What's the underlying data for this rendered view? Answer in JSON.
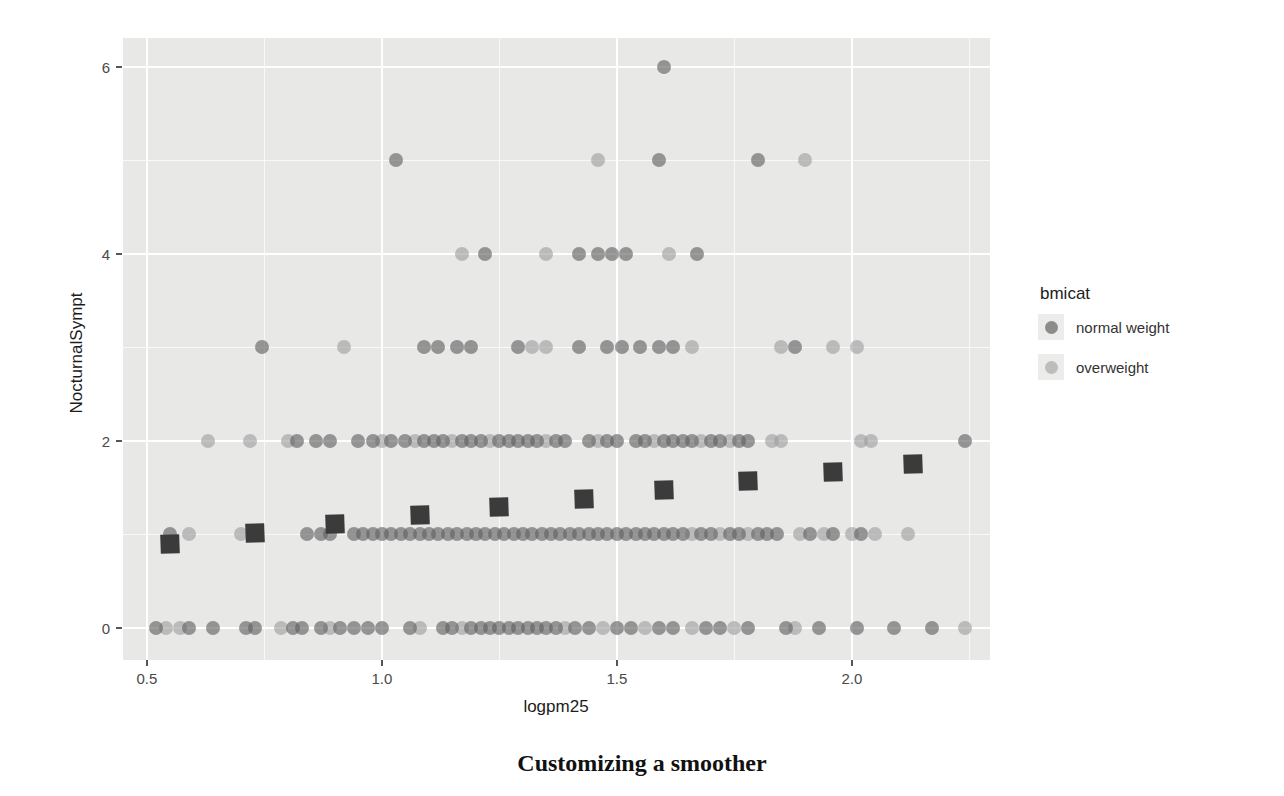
{
  "figure": {
    "caption": "Customizing a smoother"
  },
  "chart_data": {
    "type": "scatter",
    "title": "",
    "xlabel": "logpm25",
    "ylabel": "NocturnalSympt",
    "xlim": [
      0.449,
      2.294
    ],
    "ylim": [
      -0.343,
      6.31
    ],
    "x_ticks": [
      0.5,
      1.0,
      1.5,
      2.0
    ],
    "x_tick_labels": [
      "0.5",
      "1.0",
      "1.5",
      "2.0"
    ],
    "x_minor_ticks": [
      0.75,
      1.25,
      1.75,
      2.25
    ],
    "y_ticks": [
      0,
      2,
      4,
      6
    ],
    "y_tick_labels": [
      "0",
      "2",
      "4",
      "6"
    ],
    "y_minor_ticks": [
      1,
      3,
      5
    ],
    "grid": "on",
    "panel_bg": "#e8e8e6",
    "legend": {
      "position": "right",
      "title": "bmicat",
      "entries": [
        {
          "label": "normal weight",
          "color": "#8c8c8c"
        },
        {
          "label": "overweight",
          "color": "#bdbdbd"
        }
      ]
    },
    "series": [
      {
        "name": "overweight",
        "marker": "circle",
        "color": "rgba(158,158,158,0.62)",
        "points": [
          [
            0.54,
            0
          ],
          [
            0.57,
            0
          ],
          [
            0.785,
            0
          ],
          [
            0.89,
            0
          ],
          [
            1.08,
            0
          ],
          [
            1.17,
            0
          ],
          [
            1.39,
            0
          ],
          [
            1.47,
            0
          ],
          [
            1.56,
            0
          ],
          [
            1.66,
            0
          ],
          [
            1.75,
            0
          ],
          [
            1.88,
            0
          ],
          [
            2.24,
            0
          ],
          [
            0.59,
            1
          ],
          [
            0.7,
            1
          ],
          [
            1.66,
            1
          ],
          [
            1.72,
            1
          ],
          [
            1.78,
            1
          ],
          [
            1.89,
            1
          ],
          [
            1.94,
            1
          ],
          [
            2.0,
            1
          ],
          [
            2.05,
            1
          ],
          [
            2.12,
            1
          ],
          [
            0.63,
            2
          ],
          [
            0.72,
            2
          ],
          [
            0.8,
            2
          ],
          [
            1.0,
            2
          ],
          [
            1.07,
            2
          ],
          [
            1.15,
            2
          ],
          [
            1.23,
            2
          ],
          [
            1.35,
            2
          ],
          [
            1.46,
            2
          ],
          [
            1.58,
            2
          ],
          [
            1.68,
            2
          ],
          [
            1.74,
            2
          ],
          [
            1.83,
            2
          ],
          [
            1.85,
            2
          ],
          [
            2.02,
            2
          ],
          [
            2.04,
            2
          ],
          [
            0.92,
            3
          ],
          [
            1.32,
            3
          ],
          [
            1.35,
            3
          ],
          [
            1.66,
            3
          ],
          [
            1.85,
            3
          ],
          [
            1.96,
            3
          ],
          [
            2.01,
            3
          ],
          [
            1.17,
            4
          ],
          [
            1.35,
            4
          ],
          [
            1.61,
            4
          ],
          [
            1.46,
            5
          ],
          [
            1.9,
            5
          ]
        ]
      },
      {
        "name": "normal weight",
        "marker": "circle",
        "color": "rgba(95,95,95,0.62)",
        "points": [
          [
            0.52,
            0
          ],
          [
            0.59,
            0
          ],
          [
            0.64,
            0
          ],
          [
            0.71,
            0
          ],
          [
            0.73,
            0
          ],
          [
            0.81,
            0
          ],
          [
            0.83,
            0
          ],
          [
            0.87,
            0
          ],
          [
            0.91,
            0
          ],
          [
            0.94,
            0
          ],
          [
            0.97,
            0
          ],
          [
            1.0,
            0
          ],
          [
            1.06,
            0
          ],
          [
            1.13,
            0
          ],
          [
            1.15,
            0
          ],
          [
            1.19,
            0
          ],
          [
            1.21,
            0
          ],
          [
            1.23,
            0
          ],
          [
            1.25,
            0
          ],
          [
            1.27,
            0
          ],
          [
            1.29,
            0
          ],
          [
            1.31,
            0
          ],
          [
            1.33,
            0
          ],
          [
            1.35,
            0
          ],
          [
            1.37,
            0
          ],
          [
            1.41,
            0
          ],
          [
            1.44,
            0
          ],
          [
            1.5,
            0
          ],
          [
            1.53,
            0
          ],
          [
            1.59,
            0
          ],
          [
            1.62,
            0
          ],
          [
            1.69,
            0
          ],
          [
            1.72,
            0
          ],
          [
            1.78,
            0
          ],
          [
            1.86,
            0
          ],
          [
            1.93,
            0
          ],
          [
            2.01,
            0
          ],
          [
            2.09,
            0
          ],
          [
            2.17,
            0
          ],
          [
            0.55,
            1
          ],
          [
            0.84,
            1
          ],
          [
            0.87,
            1
          ],
          [
            0.89,
            1
          ],
          [
            0.94,
            1
          ],
          [
            0.96,
            1
          ],
          [
            0.98,
            1
          ],
          [
            1.0,
            1
          ],
          [
            1.02,
            1
          ],
          [
            1.04,
            1
          ],
          [
            1.06,
            1
          ],
          [
            1.08,
            1
          ],
          [
            1.1,
            1
          ],
          [
            1.12,
            1
          ],
          [
            1.14,
            1
          ],
          [
            1.16,
            1
          ],
          [
            1.18,
            1
          ],
          [
            1.2,
            1
          ],
          [
            1.22,
            1
          ],
          [
            1.24,
            1
          ],
          [
            1.26,
            1
          ],
          [
            1.28,
            1
          ],
          [
            1.3,
            1
          ],
          [
            1.32,
            1
          ],
          [
            1.34,
            1
          ],
          [
            1.36,
            1
          ],
          [
            1.38,
            1
          ],
          [
            1.4,
            1
          ],
          [
            1.42,
            1
          ],
          [
            1.44,
            1
          ],
          [
            1.46,
            1
          ],
          [
            1.48,
            1
          ],
          [
            1.5,
            1
          ],
          [
            1.52,
            1
          ],
          [
            1.54,
            1
          ],
          [
            1.56,
            1
          ],
          [
            1.58,
            1
          ],
          [
            1.6,
            1
          ],
          [
            1.62,
            1
          ],
          [
            1.64,
            1
          ],
          [
            1.68,
            1
          ],
          [
            1.7,
            1
          ],
          [
            1.74,
            1
          ],
          [
            1.76,
            1
          ],
          [
            1.8,
            1
          ],
          [
            1.82,
            1
          ],
          [
            1.84,
            1
          ],
          [
            1.91,
            1
          ],
          [
            1.96,
            1
          ],
          [
            2.02,
            1
          ],
          [
            0.82,
            2
          ],
          [
            0.86,
            2
          ],
          [
            0.89,
            2
          ],
          [
            0.95,
            2
          ],
          [
            0.98,
            2
          ],
          [
            1.02,
            2
          ],
          [
            1.05,
            2
          ],
          [
            1.09,
            2
          ],
          [
            1.11,
            2
          ],
          [
            1.13,
            2
          ],
          [
            1.17,
            2
          ],
          [
            1.19,
            2
          ],
          [
            1.21,
            2
          ],
          [
            1.25,
            2
          ],
          [
            1.27,
            2
          ],
          [
            1.29,
            2
          ],
          [
            1.31,
            2
          ],
          [
            1.33,
            2
          ],
          [
            1.37,
            2
          ],
          [
            1.39,
            2
          ],
          [
            1.44,
            2
          ],
          [
            1.48,
            2
          ],
          [
            1.5,
            2
          ],
          [
            1.54,
            2
          ],
          [
            1.56,
            2
          ],
          [
            1.6,
            2
          ],
          [
            1.62,
            2
          ],
          [
            1.64,
            2
          ],
          [
            1.66,
            2
          ],
          [
            1.7,
            2
          ],
          [
            1.72,
            2
          ],
          [
            1.76,
            2
          ],
          [
            1.78,
            2
          ],
          [
            2.24,
            2
          ],
          [
            0.745,
            3
          ],
          [
            1.09,
            3
          ],
          [
            1.12,
            3
          ],
          [
            1.16,
            3
          ],
          [
            1.19,
            3
          ],
          [
            1.29,
            3
          ],
          [
            1.42,
            3
          ],
          [
            1.48,
            3
          ],
          [
            1.51,
            3
          ],
          [
            1.55,
            3
          ],
          [
            1.59,
            3
          ],
          [
            1.62,
            3
          ],
          [
            1.88,
            3
          ],
          [
            1.22,
            4
          ],
          [
            1.42,
            4
          ],
          [
            1.46,
            4
          ],
          [
            1.49,
            4
          ],
          [
            1.52,
            4
          ],
          [
            1.67,
            4
          ],
          [
            1.03,
            5
          ],
          [
            1.59,
            5
          ],
          [
            1.8,
            5
          ],
          [
            1.6,
            6
          ]
        ]
      },
      {
        "name": "smoother",
        "marker": "square",
        "color": "#3b3b3b",
        "points": [
          [
            0.55,
            0.9
          ],
          [
            0.73,
            1.02
          ],
          [
            0.9,
            1.11
          ],
          [
            1.08,
            1.21
          ],
          [
            1.25,
            1.29
          ],
          [
            1.43,
            1.38
          ],
          [
            1.6,
            1.48
          ],
          [
            1.78,
            1.57
          ],
          [
            1.96,
            1.67
          ],
          [
            2.13,
            1.75
          ]
        ]
      }
    ]
  }
}
